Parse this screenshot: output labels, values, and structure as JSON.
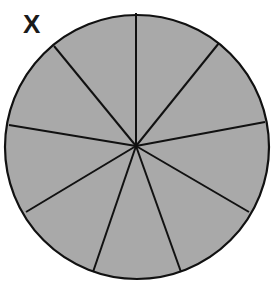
{
  "figure": {
    "label": "X",
    "fill_color": "#a9a9a9",
    "stroke_color": "#111111",
    "circle": {
      "cx": 137,
      "cy": 147,
      "r": 132
    },
    "center": {
      "x": 136,
      "y": 146
    },
    "slice_count": 9,
    "spoke_endpoints": [
      {
        "x": 136,
        "y": 13
      },
      {
        "x": 219,
        "y": 43
      },
      {
        "x": 265,
        "y": 122
      },
      {
        "x": 249,
        "y": 212
      },
      {
        "x": 181,
        "y": 272
      },
      {
        "x": 93,
        "y": 272
      },
      {
        "x": 26,
        "y": 212
      },
      {
        "x": 9,
        "y": 125
      },
      {
        "x": 54,
        "y": 46
      }
    ]
  }
}
